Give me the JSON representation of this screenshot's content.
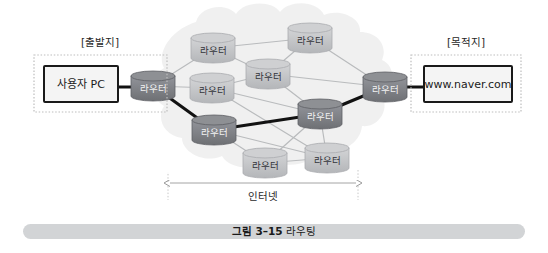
{
  "figure": {
    "caption_number": "그림 3–15",
    "caption_title": "라우팅",
    "caption_bar_color": "#d2d4d6"
  },
  "zones": {
    "source": {
      "title": "[출발지]",
      "node_label": "사용자 PC",
      "border_style": "dotted"
    },
    "destination": {
      "title": "[목적지]",
      "node_label": "www.naver.com",
      "border_style": "dotted"
    }
  },
  "cloud": {
    "label": "인터넷",
    "fill_color": "#efefef",
    "span_label": "인터넷"
  },
  "colors": {
    "router_normal_top": "#cfd0d2",
    "router_normal_body": "#bdbfc2",
    "router_path_top": "#8e9094",
    "router_path_body": "#77797d",
    "link_normal": "#b9bbbd",
    "link_path": "#121212",
    "box_border": "#1a1a1a",
    "box_fill": "#f4f4f4",
    "dotted_border": "#bdbdbd"
  },
  "routers": [
    {
      "id": "edge-left",
      "label": "라우터",
      "x": 153,
      "y": 86,
      "on_path": true
    },
    {
      "id": "r-top-left",
      "label": "라우터",
      "x": 213,
      "y": 48,
      "on_path": false
    },
    {
      "id": "r-top-right",
      "label": "라우터",
      "x": 310,
      "y": 38,
      "on_path": false
    },
    {
      "id": "r-mid-top",
      "label": "라우터",
      "x": 268,
      "y": 74,
      "on_path": false
    },
    {
      "id": "r-mid-left",
      "label": "라우터",
      "x": 212,
      "y": 88,
      "on_path": false
    },
    {
      "id": "r-low-left",
      "label": "라우터",
      "x": 214,
      "y": 130,
      "on_path": true
    },
    {
      "id": "r-mid-right",
      "label": "라우터",
      "x": 320,
      "y": 114,
      "on_path": true
    },
    {
      "id": "r-bot-left",
      "label": "라우터",
      "x": 265,
      "y": 163,
      "on_path": false
    },
    {
      "id": "r-bot-right",
      "label": "라우터",
      "x": 327,
      "y": 158,
      "on_path": false
    },
    {
      "id": "edge-right",
      "label": "라우터",
      "x": 385,
      "y": 87,
      "on_path": true
    }
  ],
  "links": [
    {
      "from": "r-top-left",
      "to": "r-top-right",
      "on_path": false
    },
    {
      "from": "r-top-left",
      "to": "r-mid-top",
      "on_path": false
    },
    {
      "from": "r-top-left",
      "to": "edge-left",
      "on_path": false
    },
    {
      "from": "r-top-right",
      "to": "edge-right",
      "on_path": false
    },
    {
      "from": "r-top-right",
      "to": "r-mid-top",
      "on_path": false
    },
    {
      "from": "r-mid-top",
      "to": "r-mid-left",
      "on_path": false
    },
    {
      "from": "r-mid-top",
      "to": "r-mid-right",
      "on_path": false
    },
    {
      "from": "r-mid-top",
      "to": "edge-right",
      "on_path": false
    },
    {
      "from": "r-mid-left",
      "to": "edge-left",
      "on_path": false
    },
    {
      "from": "r-mid-left",
      "to": "r-mid-right",
      "on_path": false
    },
    {
      "from": "r-mid-left",
      "to": "r-bot-right",
      "on_path": false
    },
    {
      "from": "r-low-left",
      "to": "r-bot-left",
      "on_path": false
    },
    {
      "from": "r-low-left",
      "to": "r-bot-right",
      "on_path": false
    },
    {
      "from": "r-bot-left",
      "to": "r-bot-right",
      "on_path": false
    },
    {
      "from": "r-bot-right",
      "to": "r-mid-right",
      "on_path": false
    },
    {
      "from": "r-mid-right",
      "to": "r-bot-left",
      "on_path": false
    },
    {
      "from": "edge-left",
      "to": "r-low-left",
      "on_path": true
    },
    {
      "from": "r-low-left",
      "to": "r-mid-right",
      "on_path": true
    },
    {
      "from": "r-mid-right",
      "to": "edge-right",
      "on_path": true
    }
  ]
}
